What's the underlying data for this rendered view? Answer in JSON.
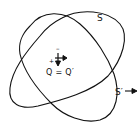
{
  "diagram": {
    "surfaces": [
      {
        "id": "S",
        "label": "S"
      },
      {
        "id": "S_prime",
        "label": "S′"
      }
    ],
    "charge": {
      "label": "Q = Q′",
      "minus_sign": "–",
      "plus_sign": "+"
    },
    "arrow_label": "outward normal arrow",
    "stroke_color": "#111111",
    "background": "#ffffff"
  }
}
